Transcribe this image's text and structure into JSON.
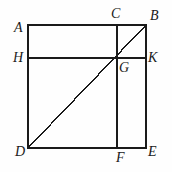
{
  "figure": {
    "stroke_color": "#1a1a1a",
    "label_color": "#1a1a1a",
    "background_color": "#fefefe",
    "stroke_width": 1.4,
    "points": {
      "A": {
        "label": "A",
        "x": 28,
        "y": 25
      },
      "B": {
        "label": "B",
        "x": 146,
        "y": 25
      },
      "C": {
        "label": "C",
        "x": 117,
        "y": 25
      },
      "D": {
        "label": "D",
        "x": 28,
        "y": 148
      },
      "E": {
        "label": "E",
        "x": 146,
        "y": 148
      },
      "F": {
        "label": "F",
        "x": 117,
        "y": 148
      },
      "G": {
        "label": "G",
        "x": 117,
        "y": 58
      },
      "H": {
        "label": "H",
        "x": 28,
        "y": 58
      },
      "K": {
        "label": "K",
        "x": 146,
        "y": 58
      }
    },
    "label_positions": {
      "A": {
        "x": 14,
        "y": 21
      },
      "B": {
        "x": 150,
        "y": 9
      },
      "C": {
        "x": 111,
        "y": 7
      },
      "D": {
        "x": 15,
        "y": 145
      },
      "E": {
        "x": 148,
        "y": 145
      },
      "F": {
        "x": 116,
        "y": 151
      },
      "G": {
        "x": 119,
        "y": 61
      },
      "H": {
        "x": 13,
        "y": 51
      },
      "K": {
        "x": 148,
        "y": 51
      }
    },
    "segments": [
      {
        "name": "top-edge-AB",
        "from": "A",
        "to": "B"
      },
      {
        "name": "left-edge-AD",
        "from": "A",
        "to": "D"
      },
      {
        "name": "bottom-edge-DE",
        "from": "D",
        "to": "E"
      },
      {
        "name": "right-edge-BE",
        "from": "B",
        "to": "E"
      },
      {
        "name": "horizontal-HK",
        "from": "H",
        "to": "K"
      },
      {
        "name": "vertical-CF",
        "from": "C",
        "to": "F"
      },
      {
        "name": "diagonal-DB",
        "from": "D",
        "to": "B"
      }
    ],
    "watermark_text": ""
  }
}
